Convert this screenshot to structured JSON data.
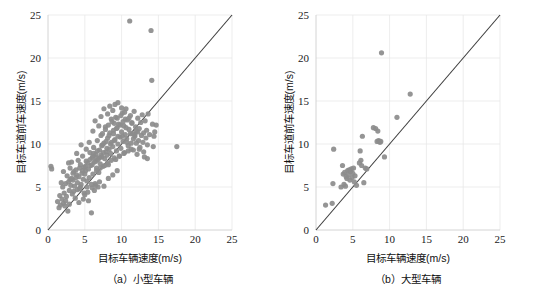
{
  "figure": {
    "background_color": "#ffffff",
    "panel_count": 2
  },
  "style": {
    "point_color": "#8c8c8c",
    "point_opacity": 0.92,
    "point_radius": 2.6,
    "line_color": "#3d3d3d",
    "grid_color": "#e8e8e8",
    "axis_color": "#cfcfcf",
    "text_color": "#111111"
  },
  "chart_data": [
    {
      "type": "scatter",
      "panel_id": "a",
      "caption": "（a）小型车辆",
      "title": "",
      "xlabel": "目标车辆速度(m/s)",
      "ylabel": "目标车道前车速度(m/s)",
      "xlim": [
        0,
        25
      ],
      "ylim": [
        0,
        25
      ],
      "xticks": [
        0,
        5,
        10,
        15,
        20,
        25
      ],
      "yticks": [
        0,
        5,
        10,
        15,
        20,
        25
      ],
      "xticklabels": [
        "0",
        "5",
        "10",
        "15",
        "20",
        "25"
      ],
      "yticklabels": [
        "0",
        "5",
        "10",
        "15",
        "20",
        "25"
      ],
      "grid": true,
      "legend": null,
      "reference_line": {
        "label": "y = x",
        "from": [
          0,
          0
        ],
        "to": [
          25,
          25
        ],
        "color": "#3d3d3d"
      },
      "points": [
        [
          0.4,
          7.4
        ],
        [
          0.5,
          7.1
        ],
        [
          1.3,
          3.3
        ],
        [
          1.5,
          2.6
        ],
        [
          1.6,
          4.0
        ],
        [
          1.7,
          2.9
        ],
        [
          1.9,
          3.6
        ],
        [
          2.0,
          5.0
        ],
        [
          2.1,
          3.1
        ],
        [
          2.2,
          4.3
        ],
        [
          2.3,
          2.8
        ],
        [
          2.4,
          5.4
        ],
        [
          2.5,
          3.9
        ],
        [
          2.6,
          6.3
        ],
        [
          2.7,
          2.2
        ],
        [
          2.8,
          5.6
        ],
        [
          2.9,
          4.6
        ],
        [
          3.0,
          7.2
        ],
        [
          3.1,
          5.2
        ],
        [
          3.2,
          6.0
        ],
        [
          3.3,
          4.2
        ],
        [
          3.4,
          5.8
        ],
        [
          3.5,
          6.8
        ],
        [
          3.6,
          5.1
        ],
        [
          3.7,
          3.7
        ],
        [
          3.8,
          7.0
        ],
        [
          3.9,
          6.4
        ],
        [
          4.0,
          5.5
        ],
        [
          4.1,
          8.1
        ],
        [
          4.2,
          6.2
        ],
        [
          4.3,
          4.8
        ],
        [
          4.4,
          7.6
        ],
        [
          4.5,
          5.3
        ],
        [
          4.6,
          6.6
        ],
        [
          4.7,
          8.6
        ],
        [
          4.8,
          5.9
        ],
        [
          4.9,
          7.3
        ],
        [
          5.0,
          4.1
        ],
        [
          5.1,
          6.9
        ],
        [
          5.2,
          8.0
        ],
        [
          5.3,
          5.7
        ],
        [
          5.4,
          7.8
        ],
        [
          5.5,
          3.4
        ],
        [
          5.6,
          6.1
        ],
        [
          5.7,
          9.0
        ],
        [
          5.8,
          7.5
        ],
        [
          5.9,
          2.0
        ],
        [
          6.0,
          8.4
        ],
        [
          6.1,
          6.5
        ],
        [
          6.2,
          9.6
        ],
        [
          6.3,
          7.9
        ],
        [
          6.4,
          5.4
        ],
        [
          6.5,
          8.8
        ],
        [
          6.6,
          7.2
        ],
        [
          6.7,
          10.4
        ],
        [
          6.8,
          8.2
        ],
        [
          6.9,
          6.7
        ],
        [
          7.0,
          9.3
        ],
        [
          7.1,
          7.7
        ],
        [
          7.2,
          11.0
        ],
        [
          7.3,
          8.5
        ],
        [
          7.4,
          9.9
        ],
        [
          7.5,
          7.4
        ],
        [
          7.6,
          10.1
        ],
        [
          7.7,
          8.3
        ],
        [
          7.8,
          12.0
        ],
        [
          7.9,
          9.1
        ],
        [
          8.0,
          8.7
        ],
        [
          8.1,
          10.7
        ],
        [
          8.2,
          7.6
        ],
        [
          8.3,
          9.4
        ],
        [
          8.4,
          11.3
        ],
        [
          8.5,
          8.9
        ],
        [
          8.6,
          10.2
        ],
        [
          8.7,
          12.6
        ],
        [
          8.8,
          9.7
        ],
        [
          8.9,
          11.6
        ],
        [
          9.0,
          8.4
        ],
        [
          9.1,
          10.5
        ],
        [
          9.2,
          13.1
        ],
        [
          9.3,
          9.2
        ],
        [
          9.4,
          11.9
        ],
        [
          9.5,
          10.0
        ],
        [
          9.6,
          12.3
        ],
        [
          9.7,
          8.6
        ],
        [
          9.8,
          10.8
        ],
        [
          9.9,
          9.5
        ],
        [
          10.0,
          11.4
        ],
        [
          10.1,
          13.6
        ],
        [
          10.2,
          10.3
        ],
        [
          10.3,
          12.1
        ],
        [
          10.4,
          9.0
        ],
        [
          10.5,
          11.1
        ],
        [
          10.6,
          14.1
        ],
        [
          10.7,
          10.6
        ],
        [
          10.8,
          12.8
        ],
        [
          10.9,
          9.8
        ],
        [
          11.0,
          11.7
        ],
        [
          11.1,
          24.3
        ],
        [
          11.2,
          13.3
        ],
        [
          11.3,
          10.1
        ],
        [
          11.4,
          12.4
        ],
        [
          11.5,
          11.2
        ],
        [
          11.6,
          9.3
        ],
        [
          11.7,
          13.8
        ],
        [
          11.8,
          10.9
        ],
        [
          11.9,
          12.0
        ],
        [
          12.0,
          11.5
        ],
        [
          12.1,
          8.8
        ],
        [
          12.2,
          13.0
        ],
        [
          12.3,
          10.4
        ],
        [
          12.4,
          11.8
        ],
        [
          12.5,
          9.6
        ],
        [
          12.6,
          12.5
        ],
        [
          12.7,
          11.0
        ],
        [
          12.8,
          13.4
        ],
        [
          12.9,
          10.2
        ],
        [
          13.0,
          11.3
        ],
        [
          13.1,
          8.5
        ],
        [
          13.2,
          12.7
        ],
        [
          13.3,
          10.7
        ],
        [
          13.4,
          11.6
        ],
        [
          13.5,
          9.9
        ],
        [
          13.6,
          13.5
        ],
        [
          13.8,
          11.1
        ],
        [
          14.0,
          23.2
        ],
        [
          14.1,
          17.4
        ],
        [
          14.2,
          12.3
        ],
        [
          14.3,
          9.7
        ],
        [
          14.4,
          10.9
        ],
        [
          14.5,
          11.4
        ],
        [
          14.7,
          12.2
        ],
        [
          17.5,
          9.7
        ],
        [
          5.2,
          9.4
        ],
        [
          5.6,
          10.2
        ],
        [
          6.1,
          11.5
        ],
        [
          6.4,
          12.7
        ],
        [
          6.9,
          12.1
        ],
        [
          7.2,
          13.2
        ],
        [
          7.6,
          14.1
        ],
        [
          8.1,
          13.5
        ],
        [
          8.4,
          14.4
        ],
        [
          8.8,
          13.9
        ],
        [
          9.1,
          14.6
        ],
        [
          9.5,
          14.8
        ],
        [
          10.0,
          14.2
        ],
        [
          10.4,
          13.7
        ],
        [
          4.5,
          9.9
        ],
        [
          3.9,
          8.9
        ],
        [
          3.2,
          7.9
        ],
        [
          2.8,
          7.8
        ],
        [
          2.1,
          6.8
        ],
        [
          1.8,
          5.5
        ],
        [
          4.2,
          3.2
        ],
        [
          4.8,
          3.6
        ],
        [
          5.4,
          4.4
        ],
        [
          6.0,
          4.9
        ],
        [
          6.5,
          5.2
        ],
        [
          7.0,
          5.6
        ],
        [
          7.6,
          5.1
        ],
        [
          8.2,
          6.0
        ],
        [
          8.8,
          6.4
        ],
        [
          9.4,
          6.9
        ],
        [
          5.0,
          6.5
        ],
        [
          5.5,
          7.1
        ],
        [
          6.0,
          7.6
        ],
        [
          6.5,
          8.0
        ],
        [
          7.0,
          8.4
        ],
        [
          7.5,
          9.0
        ],
        [
          8.0,
          9.5
        ],
        [
          8.5,
          10.0
        ],
        [
          9.0,
          10.4
        ],
        [
          9.5,
          10.9
        ],
        [
          6.2,
          8.9
        ],
        [
          6.7,
          9.2
        ],
        [
          7.3,
          9.8
        ],
        [
          7.9,
          10.3
        ],
        [
          8.3,
          11.0
        ],
        [
          8.9,
          11.2
        ],
        [
          9.3,
          11.8
        ],
        [
          9.8,
          12.2
        ],
        [
          10.2,
          12.6
        ],
        [
          10.6,
          11.9
        ],
        [
          6.6,
          6.9
        ],
        [
          7.1,
          7.2
        ],
        [
          7.7,
          7.5
        ],
        [
          8.1,
          7.8
        ],
        [
          8.6,
          8.1
        ],
        [
          9.2,
          8.2
        ],
        [
          9.7,
          8.6
        ],
        [
          10.3,
          8.9
        ],
        [
          10.9,
          9.2
        ],
        [
          11.3,
          9.4
        ],
        [
          3.5,
          4.5
        ],
        [
          4.0,
          4.7
        ],
        [
          4.4,
          5.0
        ],
        [
          2.4,
          3.4
        ],
        [
          2.9,
          3.0
        ],
        [
          11.6,
          10.6
        ],
        [
          12.0,
          10.1
        ],
        [
          12.4,
          9.4
        ],
        [
          13.0,
          9.1
        ],
        [
          13.5,
          8.3
        ],
        [
          5.9,
          5.3
        ],
        [
          6.3,
          4.6
        ],
        [
          6.8,
          5.0
        ],
        [
          5.3,
          5.0
        ],
        [
          4.9,
          4.3
        ],
        [
          7.4,
          11.2
        ],
        [
          7.8,
          11.7
        ],
        [
          8.2,
          12.2
        ],
        [
          8.6,
          12.9
        ],
        [
          9.0,
          12.4
        ],
        [
          9.4,
          13.0
        ],
        [
          9.9,
          13.3
        ],
        [
          10.5,
          12.9
        ],
        [
          11.0,
          13.0
        ],
        [
          11.4,
          12.5
        ],
        [
          10.1,
          10.9
        ],
        [
          10.7,
          10.2
        ],
        [
          11.2,
          11.2
        ],
        [
          11.8,
          11.1
        ],
        [
          12.2,
          11.4
        ],
        [
          3.0,
          5.9
        ],
        [
          3.4,
          6.6
        ],
        [
          3.8,
          6.1
        ],
        [
          4.3,
          7.2
        ],
        [
          4.7,
          6.9
        ],
        [
          5.1,
          7.4
        ],
        [
          5.7,
          8.2
        ],
        [
          6.1,
          8.6
        ],
        [
          6.6,
          8.4
        ],
        [
          7.2,
          8.7
        ]
      ]
    },
    {
      "type": "scatter",
      "panel_id": "b",
      "caption": "（b）大型车辆",
      "title": "",
      "xlabel": "目标车辆速度(m/s)",
      "ylabel": "目标车道前车速度(m/s)",
      "xlim": [
        0,
        25
      ],
      "ylim": [
        0,
        25
      ],
      "xticks": [
        0,
        5,
        10,
        15,
        20,
        25
      ],
      "yticks": [
        0,
        5,
        10,
        15,
        20,
        25
      ],
      "xticklabels": [
        "0",
        "5",
        "10",
        "15",
        "20",
        "25"
      ],
      "yticklabels": [
        "0",
        "5",
        "10",
        "15",
        "20",
        "25"
      ],
      "grid": true,
      "legend": null,
      "reference_line": {
        "label": "y = x",
        "from": [
          0,
          0
        ],
        "to": [
          25,
          25
        ],
        "color": "#3d3d3d"
      },
      "points": [
        [
          1.3,
          2.9
        ],
        [
          2.2,
          3.1
        ],
        [
          2.3,
          5.4
        ],
        [
          2.4,
          9.4
        ],
        [
          3.4,
          5.0
        ],
        [
          3.6,
          7.5
        ],
        [
          3.7,
          6.5
        ],
        [
          3.8,
          5.3
        ],
        [
          3.9,
          6.7
        ],
        [
          4.0,
          5.1
        ],
        [
          4.1,
          6.2
        ],
        [
          4.2,
          6.0
        ],
        [
          4.3,
          6.9
        ],
        [
          4.4,
          6.4
        ],
        [
          4.5,
          7.0
        ],
        [
          4.6,
          5.8
        ],
        [
          4.7,
          6.8
        ],
        [
          4.8,
          7.1
        ],
        [
          4.9,
          6.1
        ],
        [
          5.0,
          6.6
        ],
        [
          5.1,
          7.2
        ],
        [
          5.2,
          5.6
        ],
        [
          5.3,
          6.3
        ],
        [
          5.5,
          5.2
        ],
        [
          5.9,
          7.8
        ],
        [
          6.0,
          9.2
        ],
        [
          6.1,
          8.1
        ],
        [
          6.2,
          7.5
        ],
        [
          6.3,
          10.9
        ],
        [
          6.5,
          5.5
        ],
        [
          6.7,
          7.2
        ],
        [
          6.9,
          7.1
        ],
        [
          7.8,
          11.9
        ],
        [
          8.1,
          11.8
        ],
        [
          8.3,
          10.3
        ],
        [
          8.4,
          11.5
        ],
        [
          8.5,
          10.4
        ],
        [
          8.6,
          10.3
        ],
        [
          8.7,
          10.2
        ],
        [
          8.8,
          10.3
        ],
        [
          8.9,
          20.6
        ],
        [
          9.3,
          8.5
        ],
        [
          11.0,
          13.1
        ],
        [
          12.8,
          15.8
        ]
      ]
    }
  ]
}
